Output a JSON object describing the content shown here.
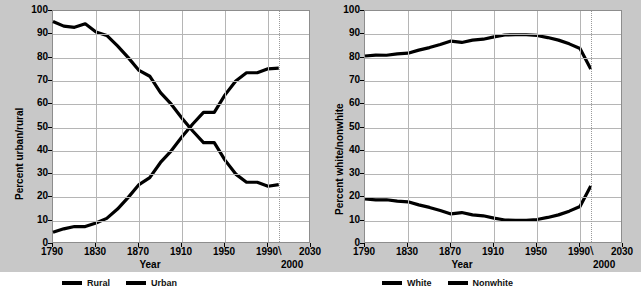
{
  "figure": {
    "background_color": "#c8c8c8",
    "plot_background_color": "#ffffff",
    "grid_color": "#b5b5b5",
    "line_color": "#000000"
  },
  "panels": [
    {
      "id": "urban-rural",
      "ylabel": "Percent urban/rural",
      "xlabel": "Year",
      "break_note": "2000",
      "break_slash": "\\",
      "yticks": [
        "0",
        "10",
        "20",
        "30",
        "40",
        "50",
        "60",
        "70",
        "80",
        "90",
        "100"
      ],
      "xticks": [
        "1790",
        "1830",
        "1870",
        "1910",
        "1950",
        "1990",
        "2030"
      ],
      "legend": [
        {
          "label": "Rural",
          "color": "#000000"
        },
        {
          "label": "Urban",
          "color": "#000000"
        }
      ]
    },
    {
      "id": "white-nonwhite",
      "ylabel": "Percent white/nonwhite",
      "xlabel": "Year",
      "break_note": "2000",
      "break_slash": "\\",
      "yticks": [
        "0",
        "10",
        "20",
        "30",
        "40",
        "50",
        "60",
        "70",
        "80",
        "90",
        "100"
      ],
      "xticks": [
        "1790",
        "1830",
        "1870",
        "1910",
        "1950",
        "1990",
        "2030"
      ],
      "legend": [
        {
          "label": "White",
          "color": "#000000"
        },
        {
          "label": "Nonwhite",
          "color": "#000000"
        }
      ]
    }
  ],
  "chart_data": [
    {
      "type": "line",
      "title": "",
      "xlabel": "Year",
      "ylabel": "Percent urban/rural",
      "xlim": [
        1790,
        2030
      ],
      "ylim": [
        0,
        100
      ],
      "grid": true,
      "legend_position": "below",
      "xticks": [
        1790,
        1830,
        1870,
        1910,
        1950,
        1990,
        2030
      ],
      "yticks": [
        0,
        10,
        20,
        30,
        40,
        50,
        60,
        70,
        80,
        90,
        100
      ],
      "annotations": [
        "2000"
      ],
      "x": [
        1790,
        1800,
        1810,
        1820,
        1830,
        1840,
        1850,
        1860,
        1870,
        1880,
        1890,
        1900,
        1910,
        1920,
        1930,
        1940,
        1950,
        1960,
        1970,
        1980,
        1990,
        2000
      ],
      "series": [
        {
          "name": "Rural",
          "values": [
            95.5,
            93.5,
            93.0,
            94.5,
            91.0,
            89.5,
            85.0,
            80.0,
            74.5,
            72.0,
            65.0,
            60.0,
            54.0,
            48.5,
            43.5,
            43.5,
            36.0,
            30.0,
            26.5,
            26.5,
            24.8,
            25.5
          ]
        },
        {
          "name": "Urban",
          "values": [
            5.0,
            6.5,
            7.5,
            7.5,
            9.0,
            11.0,
            15.0,
            20.0,
            25.5,
            28.5,
            35.0,
            40.0,
            46.0,
            51.5,
            56.5,
            56.5,
            64.0,
            70.0,
            73.5,
            73.5,
            75.2,
            75.5
          ]
        }
      ]
    },
    {
      "type": "line",
      "title": "",
      "xlabel": "Year",
      "ylabel": "Percent white/nonwhite",
      "xlim": [
        1790,
        2030
      ],
      "ylim": [
        0,
        100
      ],
      "grid": true,
      "legend_position": "below",
      "xticks": [
        1790,
        1830,
        1870,
        1910,
        1950,
        1990,
        2030
      ],
      "yticks": [
        0,
        10,
        20,
        30,
        40,
        50,
        60,
        70,
        80,
        90,
        100
      ],
      "annotations": [
        "2000"
      ],
      "x": [
        1790,
        1800,
        1810,
        1820,
        1830,
        1840,
        1850,
        1860,
        1870,
        1880,
        1890,
        1900,
        1910,
        1920,
        1930,
        1940,
        1950,
        1960,
        1970,
        1980,
        1990,
        2000
      ],
      "series": [
        {
          "name": "White",
          "values": [
            80.7,
            81.1,
            81.0,
            81.6,
            81.9,
            83.2,
            84.3,
            85.6,
            87.1,
            86.5,
            87.5,
            87.9,
            88.9,
            89.7,
            89.8,
            89.8,
            89.5,
            88.6,
            87.5,
            85.9,
            83.9,
            75.1
          ]
        },
        {
          "name": "Nonwhite",
          "values": [
            19.3,
            18.9,
            19.0,
            18.4,
            18.1,
            16.8,
            15.7,
            14.4,
            12.9,
            13.5,
            12.5,
            12.1,
            11.1,
            10.3,
            10.2,
            10.2,
            10.5,
            11.4,
            12.5,
            14.1,
            16.1,
            24.9
          ]
        }
      ]
    }
  ]
}
